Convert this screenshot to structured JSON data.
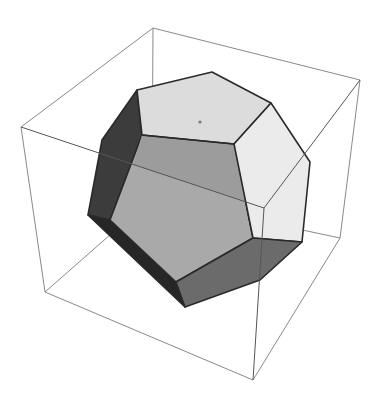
{
  "figure": {
    "width": 381,
    "height": 403
  },
  "colors": {
    "background": "#ffffff",
    "box_line": "#8a8a8a",
    "edge": "#2a2a2a",
    "face_top": "#dcdcdc",
    "face_right": "#ebebeb",
    "face_upper_mid": "#9c9c9c",
    "face_front": "#a9a9a9",
    "face_left_dark": "#3c3c3c",
    "face_bottom_strip": "#262626",
    "face_bottom": "#6b6b6b",
    "dot": "#7a7a7a"
  },
  "box": {
    "corners": {
      "top_back": [
        153,
        28
      ],
      "top_left": [
        21,
        127
      ],
      "top_right": [
        360,
        80
      ],
      "top_front": [
        264,
        208
      ],
      "bottom_left": [
        45,
        292
      ],
      "bottom_front": [
        253,
        380
      ],
      "bottom_right": [
        340,
        238
      ],
      "bottom_back": [
        152,
        198
      ]
    }
  },
  "faces": [
    {
      "name": "top",
      "points": "137,90 212,72 271,103 234,144 142,135"
    },
    {
      "name": "right",
      "points": "271,103 310,162 302,242 253,238 234,144"
    },
    {
      "name": "upper-mid",
      "points": "142,135 234,144 247,202 133,165"
    },
    {
      "name": "front",
      "points": "142,135 234,144 253,238 176,282 110,220"
    },
    {
      "name": "left-dark",
      "points": "137,90 142,135 110,220 88,215 102,140"
    },
    {
      "name": "bottom-strip",
      "points": "88,215 110,220 176,282 185,307"
    },
    {
      "name": "bottom",
      "points": "176,282 253,238 302,242 260,280 185,307"
    }
  ]
}
